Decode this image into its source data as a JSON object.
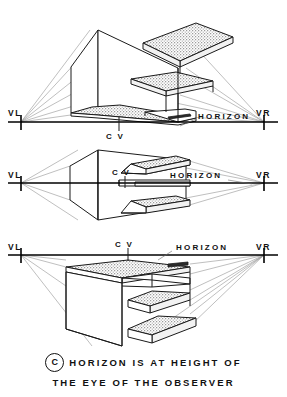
{
  "figure": {
    "caption": {
      "badge": "C",
      "line1": "HORIZON IS AT HEIGHT OF",
      "line2": "THE EYE OF THE  OBSERVER"
    }
  },
  "colors": {
    "ink": "#1a1a1a",
    "ray": "#8a8a8a",
    "stipple_fill": "#d9d9d9",
    "paper": "#ffffff"
  },
  "panels": [
    {
      "id": "panel-above",
      "name": "horizon-below-building",
      "labels": {
        "vl": "VL",
        "vr": "VR",
        "cv": "C V",
        "horizon": "HORIZON"
      },
      "geometry": {
        "horizon_y": 122,
        "vl_x": 21,
        "vr_x": 264,
        "cv_x": 119,
        "cv_label_below": true
      }
    },
    {
      "id": "panel-level",
      "name": "horizon-through-building",
      "labels": {
        "vl": "VL",
        "vr": "VR",
        "cv": "C V",
        "horizon": "HORIZON"
      },
      "geometry": {
        "horizon_y": 183,
        "vl_x": 21,
        "vr_x": 264,
        "cv_x": 125,
        "cv_label_below": false
      }
    },
    {
      "id": "panel-below",
      "name": "horizon-above-building",
      "labels": {
        "vl": "VL",
        "vr": "VR",
        "cv": "C V",
        "horizon": "HORIZON"
      },
      "geometry": {
        "horizon_y": 255,
        "vl_x": 21,
        "vr_x": 264,
        "cv_x": 128,
        "cv_label_below": false
      }
    }
  ]
}
